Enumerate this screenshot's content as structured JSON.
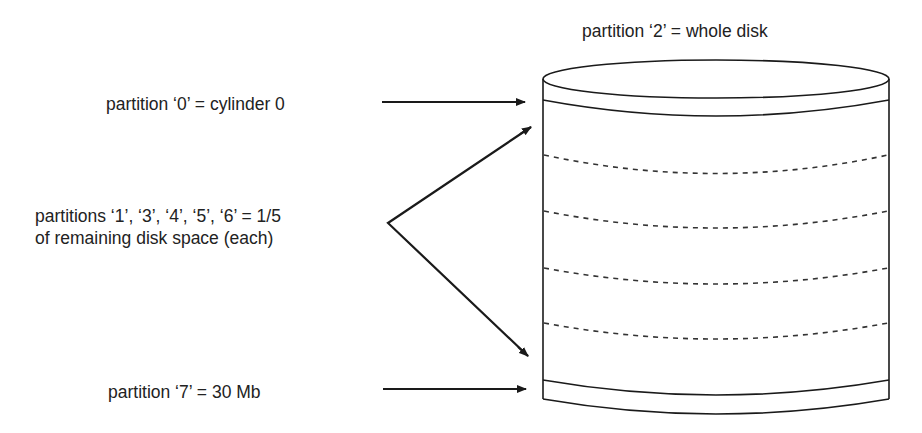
{
  "diagram": {
    "labels": {
      "whole_disk": "partition ‘2’ = whole disk",
      "cylinder0": "partition ‘0’ = cylinder 0",
      "middle_line1": "partitions ‘1’, ‘3’, ‘4’, ‘5’, ‘6’ = 1/5",
      "middle_line2": "of remaining disk space (each)",
      "last": "partition ‘7’ = 30 Mb"
    },
    "partitions": [
      {
        "id": "0",
        "description": "cylinder 0",
        "position": "top band"
      },
      {
        "id": "1",
        "description": "1/5 of remaining disk space"
      },
      {
        "id": "3",
        "description": "1/5 of remaining disk space"
      },
      {
        "id": "4",
        "description": "1/5 of remaining disk space"
      },
      {
        "id": "5",
        "description": "1/5 of remaining disk space"
      },
      {
        "id": "6",
        "description": "1/5 of remaining disk space"
      },
      {
        "id": "7",
        "description": "30 Mb",
        "position": "bottom band"
      },
      {
        "id": "2",
        "description": "whole disk"
      }
    ],
    "colors": {
      "stroke": "#1a1a1a",
      "text": "#222222",
      "background": "#ffffff"
    }
  }
}
